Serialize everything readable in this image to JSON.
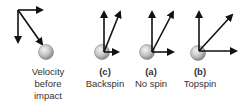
{
  "colors": {
    "arrow": "#111111",
    "ball_light": "#f2f2f2",
    "ball_dark": "#8a8a8a",
    "text": "#333333"
  },
  "panels": [
    {
      "id": "before",
      "label_lines": [
        "Velocity",
        "before",
        "impact"
      ],
      "vectors": [
        "down",
        "right",
        "down-right-diagonal"
      ]
    },
    {
      "id": "c",
      "tag": "(c)",
      "label": "Backspin",
      "vectors": [
        "up",
        "right",
        "up-right-diagonal"
      ]
    },
    {
      "id": "a",
      "tag": "(a)",
      "label": "No spin",
      "vectors": [
        "up",
        "right",
        "up-right-diagonal"
      ]
    },
    {
      "id": "b",
      "tag": "(b)",
      "label": "Topspin",
      "vectors": [
        "up",
        "right",
        "up-right-diagonal"
      ]
    }
  ]
}
